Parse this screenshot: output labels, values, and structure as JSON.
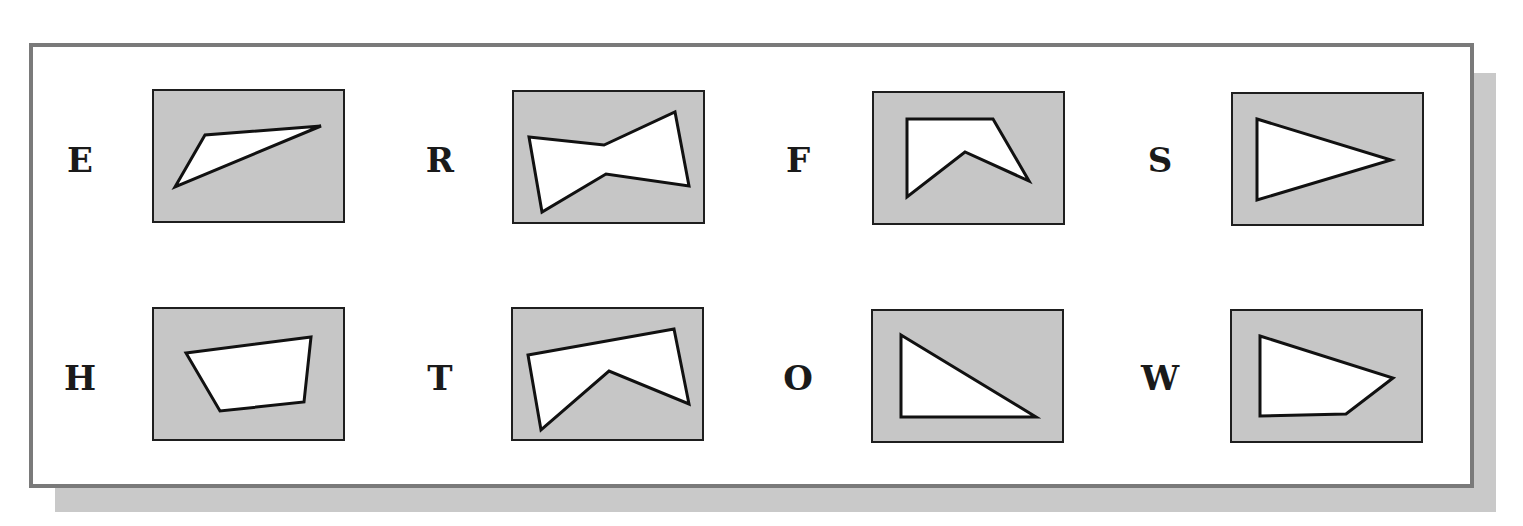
{
  "figure": {
    "colors": {
      "panel_border": "#7a7a7a",
      "shadow": "#c9c9c9",
      "box_fill": "#c6c6c6",
      "shape_fill": "#ffffff",
      "stroke": "#111111"
    },
    "items": [
      {
        "label": "E",
        "shape": "triangle",
        "points": "23,98 53,46 169,37"
      },
      {
        "label": "R",
        "shape": "hexagon-bowtie",
        "points": "17,47 92,55 163,22 177,96 94,84 30,122"
      },
      {
        "label": "F",
        "shape": "concave-pentagon",
        "points": "35,28 121,28 157,90 93,61 35,106"
      },
      {
        "label": "S",
        "shape": "triangle",
        "points": "26,27 160,68 26,108"
      },
      {
        "label": "H",
        "shape": "quadrilateral",
        "points": "34,46 159,30 152,95 68,104"
      },
      {
        "label": "T",
        "shape": "concave-pentagon",
        "points": "17,48 163,22 178,97 98,64 30,123"
      },
      {
        "label": "O",
        "shape": "right-triangle",
        "points": "30,26 165,108 30,108"
      },
      {
        "label": "W",
        "shape": "quadrilateral",
        "points": "30,27 163,69 116,105 30,107"
      }
    ]
  }
}
